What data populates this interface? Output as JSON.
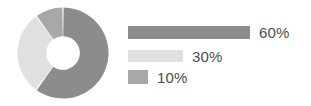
{
  "chart_data": {
    "type": "pie",
    "variant": "donut",
    "title": "",
    "subtitle": "",
    "xlabel": "",
    "ylabel": "",
    "categories": [
      "60%",
      "30%",
      "10%"
    ],
    "values": [
      60,
      30,
      10
    ],
    "value_unit": "%",
    "total": 100,
    "legend_position": "right",
    "grid": false,
    "start_angle_deg": 0,
    "direction": "clockwise",
    "inner_radius_ratio": 0.37,
    "slices": [
      {
        "label": "60%",
        "value": 60,
        "color": "#8c8c8c",
        "start_angle_deg": 0,
        "end_angle_deg": 216
      },
      {
        "label": "30%",
        "value": 30,
        "color": "#e0e0e0",
        "start_angle_deg": 216,
        "end_angle_deg": 324
      },
      {
        "label": "10%",
        "value": 10,
        "color": "#a8a8a8",
        "start_angle_deg": 324,
        "end_angle_deg": 360
      }
    ]
  },
  "legend": {
    "items": [
      {
        "label": "60%",
        "value": 60,
        "color": "#8c8c8c",
        "bar_width_px": 122
      },
      {
        "label": "30%",
        "value": 30,
        "color": "#e0e0e0",
        "bar_width_px": 55
      },
      {
        "label": "10%",
        "value": 10,
        "color": "#a8a8a8",
        "bar_width_px": 20
      }
    ]
  },
  "colors": {
    "background": "#ffffff",
    "slice_major": "#8c8c8c",
    "slice_minor": "#e0e0e0",
    "slice_small": "#a8a8a8",
    "text": "#4d4d4d",
    "separator": "#ffffff"
  }
}
